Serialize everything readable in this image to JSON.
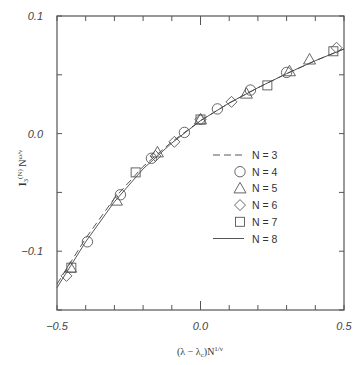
{
  "chart_data": {
    "type": "scatter",
    "title": "",
    "xlabel": "(λ − λc)N^(1/ν)",
    "ylabel": "I3^(N) N^(ω/ν)",
    "xlim": [
      -0.5,
      0.5
    ],
    "ylim": [
      -0.15,
      0.1
    ],
    "x_ticks": [
      -0.5,
      -0.4,
      -0.3,
      -0.2,
      -0.1,
      0.0,
      0.1,
      0.2,
      0.3,
      0.4,
      0.5
    ],
    "x_tick_labels": [
      "-0.5",
      "0.0",
      "0.5"
    ],
    "y_ticks": [
      -0.15,
      -0.1,
      -0.05,
      0.0,
      0.05,
      0.1
    ],
    "y_tick_labels": [
      "-0.1",
      "0.0",
      "0.1"
    ],
    "grid": false,
    "legend_position": "center-right",
    "series": [
      {
        "name": "N = 3",
        "style": "dashed-line",
        "x": [
          -0.5,
          -0.4,
          -0.3,
          -0.2,
          -0.1,
          0.0,
          0.1,
          0.2,
          0.3,
          0.4,
          0.5
        ],
        "y": [
          -0.128,
          -0.089,
          -0.055,
          -0.028,
          -0.007,
          0.011,
          0.026,
          0.039,
          0.051,
          0.062,
          0.072
        ]
      },
      {
        "name": "N = 4",
        "style": "circle",
        "x": [
          -0.394,
          -0.279,
          -0.171,
          -0.056,
          0.059,
          0.174,
          0.3
        ],
        "y": [
          -0.092,
          -0.052,
          -0.021,
          0.001,
          0.021,
          0.037,
          0.052
        ]
      },
      {
        "name": "N = 5",
        "style": "triangle",
        "x": [
          -0.453,
          -0.293,
          -0.15,
          0.0,
          0.16,
          0.31,
          0.38
        ],
        "y": [
          -0.114,
          -0.057,
          -0.016,
          0.012,
          0.034,
          0.053,
          0.063
        ]
      },
      {
        "name": "N = 6",
        "style": "diamond",
        "x": [
          -0.467,
          -0.157,
          -0.091,
          0.0,
          0.108,
          0.474
        ],
        "y": [
          -0.121,
          -0.019,
          -0.007,
          0.012,
          0.027,
          0.073
        ]
      },
      {
        "name": "N = 7",
        "style": "square",
        "x": [
          -0.45,
          -0.226,
          0.0,
          0.233,
          0.463
        ],
        "y": [
          -0.114,
          -0.033,
          0.012,
          0.041,
          0.07
        ]
      },
      {
        "name": "N = 8",
        "style": "solid-line",
        "x": [
          -0.5,
          -0.4,
          -0.3,
          -0.2,
          -0.1,
          0.0,
          0.1,
          0.2,
          0.3,
          0.4,
          0.5
        ],
        "y": [
          -0.131,
          -0.092,
          -0.058,
          -0.03,
          -0.008,
          0.011,
          0.026,
          0.039,
          0.051,
          0.062,
          0.072
        ]
      }
    ]
  },
  "axes": {
    "x_label_main": "(λ − λ",
    "x_label_sub": "c",
    "x_label_tail": ")N",
    "x_label_sup": "1/ν",
    "y_label_main": "I",
    "y_label_sub": "3",
    "y_label_sup1": "(N)",
    "y_label_mid": " N",
    "y_label_sup2": "ω/ν"
  },
  "legend": {
    "items": [
      {
        "label": "N = 3",
        "marker": "dashed-line"
      },
      {
        "label": "N = 4",
        "marker": "circle"
      },
      {
        "label": "N = 5",
        "marker": "triangle"
      },
      {
        "label": "N = 6",
        "marker": "diamond"
      },
      {
        "label": "N = 7",
        "marker": "square"
      },
      {
        "label": "N = 8",
        "marker": "solid-line"
      }
    ]
  },
  "colors": {
    "frame": "#555555",
    "line": "#444444",
    "marker": "#555555",
    "text": "#333333"
  }
}
